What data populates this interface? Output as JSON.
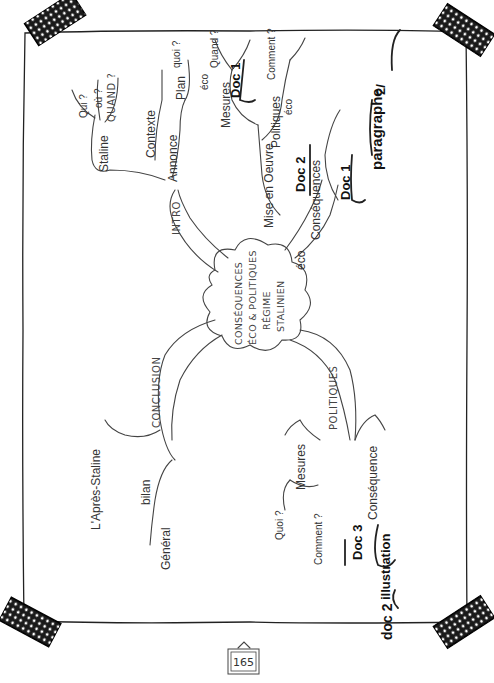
{
  "page": {
    "page_number": "165",
    "orientation": "rotated-90-ccw"
  },
  "mindmap": {
    "center": {
      "lines": [
        "CONSÉQUENCES",
        "ÉCO & POLITIQUES",
        "RÉGIME",
        "STALINIEN"
      ]
    },
    "intro": {
      "label": "INTRO",
      "staline": {
        "label": "Staline",
        "questions": [
          "Qui ?",
          "où ?",
          "QUAND ?"
        ]
      },
      "contexte": {
        "label": "Contexte"
      },
      "annonce": {
        "label": "Annonce",
        "child": "Plan"
      }
    },
    "eco": {
      "label": "éco",
      "mise_en_oeuvre": {
        "label": "Mise en Oeuvre",
        "mesures": {
          "label": "Mesures",
          "eco": "éco",
          "questions": [
            "quoi ?",
            "Quand ?"
          ],
          "doc": "Doc 1"
        },
        "politiques": {
          "label": "Politiques",
          "eco": "éco",
          "question": "Comment ?"
        }
      },
      "doc2": "Doc 2",
      "consequences": {
        "label": "Conséquences",
        "doc": "Doc 1",
        "section_num": "2/",
        "section_label": "paragraphe"
      }
    },
    "politiques": {
      "label": "POLITIQUES",
      "mesures": {
        "label": "Mesures",
        "questions": [
          "Quoi ?",
          "Comment ?"
        ]
      },
      "consequence": {
        "label": "Conséquence",
        "doc3": "Doc 3",
        "illustration": "illustration",
        "doc2": "doc 2"
      }
    },
    "conclusion": {
      "label": "CONCLUSION",
      "apres_staline": "L'Après-Staline",
      "bilan": "bilan",
      "general": "Général"
    }
  }
}
